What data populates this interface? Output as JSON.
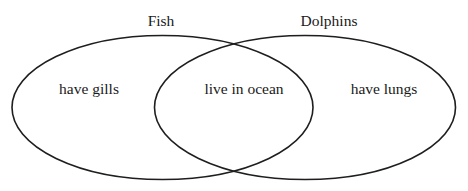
{
  "diagram": {
    "type": "venn",
    "sets": [
      {
        "name": "Fish",
        "unique_label": "have gills"
      },
      {
        "name": "Dolphins",
        "unique_label": "have lungs"
      }
    ],
    "intersection_label": "live in ocean",
    "colors": {
      "stroke": "#1e1e1e",
      "text": "#1a1a1a",
      "background": "#ffffff"
    }
  }
}
